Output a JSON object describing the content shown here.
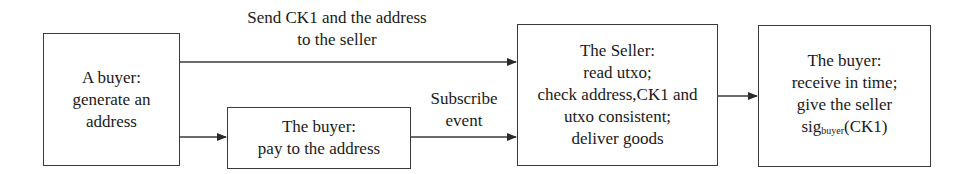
{
  "diagram": {
    "type": "flowchart",
    "nodes": [
      {
        "id": "buyer-generate",
        "lines": [
          "A buyer:",
          "generate an",
          "address"
        ]
      },
      {
        "id": "buyer-pay",
        "lines": [
          "The buyer:",
          "pay to the address"
        ]
      },
      {
        "id": "seller",
        "lines": [
          "The Seller:",
          "read utxo;",
          "check address,CK1 and",
          "utxo consistent;",
          "deliver goods"
        ]
      },
      {
        "id": "buyer-receive",
        "lines": [
          "The buyer:",
          "receive in time;",
          "give the seller"
        ],
        "signature": {
          "base": "sig",
          "subscript": "buyer",
          "arg": "(CK1)"
        }
      }
    ],
    "edges": [
      {
        "from": "buyer-generate",
        "to": "seller",
        "label_lines": [
          "Send CK1 and the address",
          "to the seller"
        ]
      },
      {
        "from": "buyer-generate",
        "to": "buyer-pay",
        "label_lines": []
      },
      {
        "from": "buyer-pay",
        "to": "seller",
        "label_lines": [
          "Subscribe",
          "event"
        ]
      },
      {
        "from": "seller",
        "to": "buyer-receive",
        "label_lines": []
      }
    ],
    "colors": {
      "stroke": "#3a3a3a",
      "text": "#1a1a1a",
      "background": "#ffffff"
    }
  }
}
